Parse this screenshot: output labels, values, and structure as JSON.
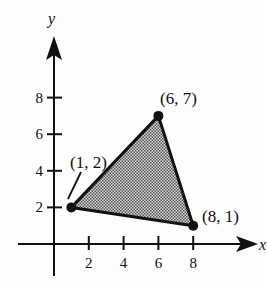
{
  "figure": {
    "type": "coordinate-plane-triangle",
    "axes": {
      "x_label": "x",
      "y_label": "y",
      "x_ticks": [
        2,
        4,
        6,
        8
      ],
      "y_ticks": [
        2,
        4,
        6,
        8
      ],
      "x_tick_labels": [
        "2",
        "4",
        "6",
        "8"
      ],
      "y_tick_labels": [
        "2",
        "4",
        "6",
        "8"
      ]
    },
    "vertices": [
      {
        "x": 1,
        "y": 2,
        "label": "(1, 2)"
      },
      {
        "x": 6,
        "y": 7,
        "label": "(6, 7)"
      },
      {
        "x": 8,
        "y": 1,
        "label": "(8, 1)"
      }
    ],
    "fill": "shaded (stippled gray)",
    "colors": {
      "line": "#111111",
      "fill": "#9a9a9a"
    }
  }
}
